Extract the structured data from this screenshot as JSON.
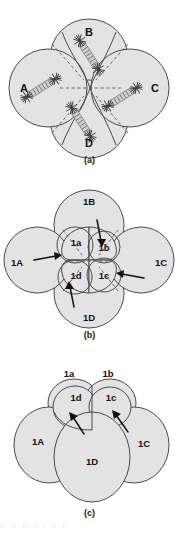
{
  "figure": {
    "background_color": "#ffffff",
    "cell_fill_color": "#e3e3e3",
    "cell_outline_color": "#4a4a4a",
    "label_color": "#121212",
    "arrow_color": "#111111",
    "spindle_color": "#cfcfcf",
    "footer_text": "II. II. II.                    I. I. II. I."
  },
  "panels": [
    {
      "id": "a",
      "caption": "(a)",
      "description": "Four-cell embryo with obliquely oriented mitotic spindles",
      "cells": [
        {
          "name": "A",
          "label": "A",
          "position": "left"
        },
        {
          "name": "B",
          "label": "B",
          "position": "top"
        },
        {
          "name": "C",
          "label": "C",
          "position": "right"
        },
        {
          "name": "D",
          "label": "D",
          "position": "bottom"
        }
      ],
      "spindles": [
        {
          "cell": "A",
          "orientation": "oblique"
        },
        {
          "cell": "B",
          "orientation": "oblique"
        },
        {
          "cell": "C",
          "orientation": "oblique"
        },
        {
          "cell": "D",
          "orientation": "oblique"
        }
      ],
      "spindle_count": 4,
      "aster_count": 8
    },
    {
      "id": "b",
      "caption": "(b)",
      "description": "Eight-cell embryo, micromeres displaced clockwise relative to macromeres",
      "cells": [
        {
          "name": "1A",
          "label": "1A",
          "type": "macromere",
          "position": "left"
        },
        {
          "name": "1B",
          "label": "1B",
          "type": "macromere",
          "position": "top"
        },
        {
          "name": "1C",
          "label": "1C",
          "type": "macromere",
          "position": "right"
        },
        {
          "name": "1D",
          "label": "1D",
          "type": "macromere",
          "position": "bottom"
        },
        {
          "name": "1a",
          "label": "1a",
          "type": "micromere",
          "position": "inner-top-left"
        },
        {
          "name": "1b",
          "label": "1b",
          "type": "micromere",
          "position": "inner-top-right"
        },
        {
          "name": "1c",
          "label": "1c",
          "type": "micromere",
          "position": "inner-bottom-right"
        },
        {
          "name": "1d",
          "label": "1d",
          "type": "micromere",
          "position": "inner-bottom-left"
        }
      ],
      "arrows": [
        {
          "from": "1A",
          "direction": "right",
          "meaning": "displacement"
        },
        {
          "from": "1B",
          "direction": "down",
          "meaning": "displacement"
        },
        {
          "from": "1C",
          "direction": "left",
          "meaning": "displacement"
        },
        {
          "from": "1D",
          "direction": "up",
          "meaning": "displacement"
        }
      ],
      "arrow_count": 4
    },
    {
      "id": "c",
      "caption": "(c)",
      "description": "Side view of the eight-cell embryo showing micromeres atop macromeres",
      "cells": [
        {
          "name": "1a",
          "label": "1a",
          "type": "micromere",
          "position": "top-left-outer"
        },
        {
          "name": "1b",
          "label": "1b",
          "type": "micromere",
          "position": "top-right-outer"
        },
        {
          "name": "1d",
          "label": "1d",
          "type": "micromere",
          "position": "top-left-inner"
        },
        {
          "name": "1c",
          "label": "1c",
          "type": "micromere",
          "position": "top-right-inner"
        },
        {
          "name": "1A",
          "label": "1A",
          "type": "macromere",
          "position": "left"
        },
        {
          "name": "1C",
          "label": "1C",
          "type": "macromere",
          "position": "right"
        },
        {
          "name": "1D",
          "label": "1D",
          "type": "macromere",
          "position": "center-front"
        }
      ],
      "arrows": [
        {
          "near": "1d",
          "direction": "up-left",
          "meaning": "displacement"
        },
        {
          "near": "1c",
          "direction": "up-left",
          "meaning": "displacement"
        }
      ],
      "arrow_count": 2
    }
  ]
}
